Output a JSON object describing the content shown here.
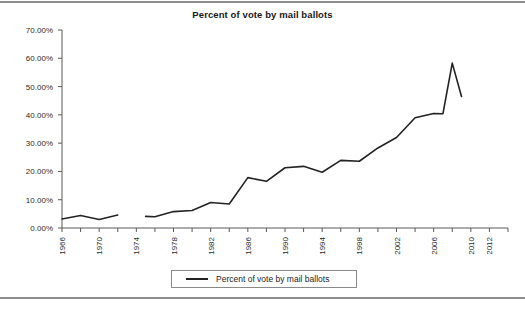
{
  "chart_data": {
    "type": "line",
    "title": "Percent of vote by mail ballots",
    "xlabel": "",
    "ylabel": "",
    "ylim": [
      0,
      70
    ],
    "xlim": [
      1966,
      2014
    ],
    "grid": false,
    "legend_position": "bottom",
    "y_tick_labels": [
      "70.00%",
      "60.00%",
      "50.00%",
      "40.00%",
      "30.00%",
      "20.00%",
      "10.00%",
      "0.00%"
    ],
    "y_tick_values": [
      70,
      60,
      50,
      40,
      30,
      20,
      10,
      0
    ],
    "x_tick_labels": [
      "1966",
      "1970",
      "1974",
      "1978",
      "1982",
      "1986",
      "1990",
      "1994",
      "1998",
      "2002",
      "2006",
      "2010",
      "2012"
    ],
    "x_tick_values": [
      1966,
      1970,
      1974,
      1978,
      1982,
      1986,
      1990,
      1994,
      1998,
      2002,
      2006,
      2010,
      2012
    ],
    "x_minor_step": 2,
    "series": [
      {
        "name": "Percent of vote by mail ballots",
        "color": "#232323",
        "x": [
          1966,
          1968,
          1970,
          1972,
          1974,
          1976,
          1978,
          1980,
          1982,
          1984,
          1986,
          1988,
          1990,
          1992,
          1994,
          1996,
          1998,
          2000,
          2002,
          2004,
          2006,
          2008,
          2010,
          2012
        ],
        "values": [
          3.2,
          4.4,
          3.0,
          4.6,
          null,
          4.1,
          4.0,
          5.8,
          6.2,
          9.0,
          8.5,
          17.8,
          16.5,
          21.3,
          21.8,
          19.7,
          23.9,
          23.6,
          28.3,
          32.0,
          39.0,
          40.5,
          40.4,
          58.3
        ],
        "notes": "data gap between 1972 and 1974"
      }
    ],
    "data_points": [
      {
        "year": 1966,
        "value": 3.2
      },
      {
        "year": 1968,
        "value": 4.4
      },
      {
        "year": 1970,
        "value": 3.0
      },
      {
        "year": 1972,
        "value": 4.6
      },
      {
        "year": 1975,
        "value": 4.1
      },
      {
        "year": 1976,
        "value": 4.0
      },
      {
        "year": 1978,
        "value": 5.8
      },
      {
        "year": 1980,
        "value": 6.2
      },
      {
        "year": 1982,
        "value": 9.0
      },
      {
        "year": 1984,
        "value": 8.5
      },
      {
        "year": 1986,
        "value": 17.8
      },
      {
        "year": 1988,
        "value": 16.5
      },
      {
        "year": 1990,
        "value": 21.3
      },
      {
        "year": 1992,
        "value": 21.8
      },
      {
        "year": 1994,
        "value": 19.7
      },
      {
        "year": 1996,
        "value": 23.9
      },
      {
        "year": 1998,
        "value": 23.6
      },
      {
        "year": 2000,
        "value": 28.3
      },
      {
        "year": 2002,
        "value": 32.0
      },
      {
        "year": 2004,
        "value": 39.0
      },
      {
        "year": 2006,
        "value": 40.5
      },
      {
        "year": 2007,
        "value": 40.4
      },
      {
        "year": 2008,
        "value": 58.3
      },
      {
        "year": 2009,
        "value": 46.5
      },
      {
        "year": 2012,
        "value": 49.8
      }
    ]
  },
  "legend": {
    "entry_label": "Percent of vote by mail ballots"
  },
  "footer": {
    "source_note": ""
  }
}
